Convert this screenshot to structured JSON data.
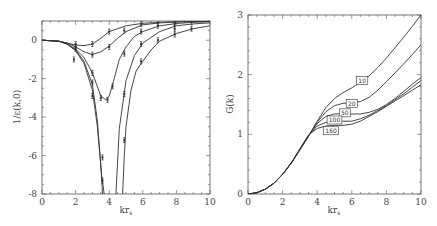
{
  "chart_data": [
    {
      "type": "line",
      "title": "",
      "xlabel": "kr_s",
      "ylabel": "1/ε(k,0)",
      "xlim": [
        0,
        10
      ],
      "ylim": [
        -8,
        1
      ],
      "xticks": [
        0,
        2,
        4,
        6,
        8,
        10
      ],
      "yticks": [
        0,
        -2,
        -4,
        -6,
        -8
      ],
      "grid": false,
      "series": [
        {
          "name": "curve1",
          "x": [
            0,
            1,
            1.5,
            2,
            2.5,
            3,
            3.5,
            4,
            5,
            6,
            7,
            8,
            9,
            10
          ],
          "y": [
            0,
            -0.05,
            -0.15,
            -0.25,
            -0.28,
            -0.2,
            0.1,
            0.45,
            0.75,
            0.88,
            0.93,
            0.96,
            0.97,
            0.98
          ]
        },
        {
          "name": "curve2",
          "x": [
            0,
            1,
            1.5,
            2,
            2.5,
            3,
            3.5,
            4,
            4.5,
            5,
            6,
            7,
            8,
            9,
            10
          ],
          "y": [
            0,
            -0.05,
            -0.15,
            -0.35,
            -0.6,
            -0.75,
            -0.6,
            -0.3,
            0.1,
            0.45,
            0.8,
            0.9,
            0.95,
            0.97,
            0.98
          ]
        },
        {
          "name": "curve3",
          "x": [
            0,
            1,
            1.5,
            2,
            2.5,
            3,
            3.5,
            3.8,
            4,
            4.3,
            4.6,
            5,
            5.5,
            6,
            7,
            8,
            9,
            10
          ],
          "y": [
            0,
            -0.05,
            -0.2,
            -0.45,
            -0.9,
            -1.7,
            -2.9,
            -3.1,
            -2.9,
            -2.0,
            -1.0,
            -0.35,
            0.2,
            0.45,
            0.75,
            0.87,
            0.93,
            0.96
          ]
        },
        {
          "name": "curve4",
          "x": [
            0,
            1,
            1.5,
            2,
            2.5,
            3,
            3.3,
            3.5,
            3.6
          ],
          "y": [
            0,
            -0.05,
            -0.2,
            -0.5,
            -1.1,
            -2.3,
            -4.2,
            -6.5,
            -8
          ]
        },
        {
          "name": "curve4b",
          "x": [
            4.4,
            4.6,
            5,
            5.5,
            6,
            7,
            8,
            9,
            10
          ],
          "y": [
            -8,
            -4.6,
            -2.1,
            -0.8,
            -0.15,
            0.45,
            0.75,
            0.85,
            0.9
          ]
        },
        {
          "name": "curve5",
          "x": [
            0,
            1,
            1.5,
            2,
            2.5,
            3,
            3.3,
            3.55,
            3.7
          ],
          "y": [
            0,
            -0.05,
            -0.2,
            -0.55,
            -1.2,
            -2.6,
            -4.5,
            -7,
            -8
          ]
        },
        {
          "name": "curve5b",
          "x": [
            4.8,
            4.9,
            5,
            5.3,
            5.6,
            6,
            6.5,
            7,
            8,
            9,
            10
          ],
          "y": [
            -8,
            -6,
            -4.5,
            -2.6,
            -1.6,
            -1.1,
            -0.5,
            -0.05,
            0.35,
            0.6,
            0.75
          ]
        }
      ],
      "points": [
        {
          "x": 2,
          "y": -0.2
        },
        {
          "x": 2,
          "y": -0.35
        },
        {
          "x": 2,
          "y": -0.45
        },
        {
          "x": 1.9,
          "y": -1.0
        },
        {
          "x": 3,
          "y": -0.2
        },
        {
          "x": 3,
          "y": -0.75
        },
        {
          "x": 3,
          "y": -1.7
        },
        {
          "x": 3,
          "y": -2.2
        },
        {
          "x": 3,
          "y": -2.9
        },
        {
          "x": 3.5,
          "y": -3.0
        },
        {
          "x": 3.6,
          "y": -6.1
        },
        {
          "x": 3.6,
          "y": -7.3
        },
        {
          "x": 3.9,
          "y": -3.1
        },
        {
          "x": 4,
          "y": 0.45
        },
        {
          "x": 4,
          "y": -0.35
        },
        {
          "x": 4.2,
          "y": -2.4
        },
        {
          "x": 4.9,
          "y": 0.5
        },
        {
          "x": 4.9,
          "y": -0.7
        },
        {
          "x": 4.9,
          "y": -2.8
        },
        {
          "x": 4.9,
          "y": -5.2
        },
        {
          "x": 5.9,
          "y": 0.85
        },
        {
          "x": 5.9,
          "y": 0.45
        },
        {
          "x": 5.9,
          "y": -0.2
        },
        {
          "x": 5.9,
          "y": -1.1
        },
        {
          "x": 6.9,
          "y": 0.9
        },
        {
          "x": 6.9,
          "y": 0.75
        },
        {
          "x": 6.9,
          "y": 0.0
        },
        {
          "x": 7.9,
          "y": 0.93
        },
        {
          "x": 7.9,
          "y": 0.9
        },
        {
          "x": 7.9,
          "y": 0.6
        },
        {
          "x": 7.9,
          "y": 0.3
        },
        {
          "x": 8.9,
          "y": 0.95
        },
        {
          "x": 8.9,
          "y": 0.6
        }
      ]
    },
    {
      "type": "line",
      "title": "",
      "xlabel": "kr_s",
      "ylabel": "G(k)",
      "xlim": [
        0,
        10
      ],
      "ylim": [
        0,
        3
      ],
      "xticks": [
        0,
        2,
        4,
        6,
        8,
        10
      ],
      "yticks": [
        0,
        1,
        2,
        3
      ],
      "grid": false,
      "series": [
        {
          "name": "10",
          "label_pos": [
            6.6,
            1.9
          ],
          "x": [
            0,
            0.5,
            1,
            1.5,
            2,
            2.5,
            3,
            3.5,
            4,
            4.5,
            5,
            5.5,
            6,
            6.5,
            7,
            7.5,
            8,
            8.5,
            9,
            9.5,
            10
          ],
          "y": [
            0,
            0.02,
            0.08,
            0.18,
            0.33,
            0.52,
            0.74,
            0.97,
            1.22,
            1.45,
            1.6,
            1.7,
            1.78,
            1.87,
            1.98,
            2.12,
            2.28,
            2.45,
            2.63,
            2.81,
            3.0
          ]
        },
        {
          "name": "20",
          "label_pos": [
            6.0,
            1.52
          ],
          "x": [
            0,
            0.5,
            1,
            1.5,
            2,
            2.5,
            3,
            3.5,
            4,
            4.5,
            5,
            5.5,
            6,
            6.5,
            7,
            7.5,
            8,
            8.5,
            9,
            9.5,
            10
          ],
          "y": [
            0,
            0.02,
            0.08,
            0.18,
            0.33,
            0.52,
            0.74,
            0.97,
            1.2,
            1.38,
            1.48,
            1.52,
            1.53,
            1.55,
            1.62,
            1.74,
            1.88,
            2.03,
            2.18,
            2.34,
            2.5
          ]
        },
        {
          "name": "50",
          "label_pos": [
            5.6,
            1.36
          ],
          "x": [
            0,
            0.5,
            1,
            1.5,
            2,
            2.5,
            3,
            3.5,
            4,
            4.5,
            5,
            5.5,
            6,
            6.5,
            7,
            7.5,
            8,
            8.5,
            9,
            9.5,
            10
          ],
          "y": [
            0,
            0.02,
            0.08,
            0.18,
            0.33,
            0.52,
            0.75,
            0.98,
            1.18,
            1.3,
            1.34,
            1.35,
            1.34,
            1.34,
            1.37,
            1.42,
            1.5,
            1.6,
            1.72,
            1.84,
            1.95
          ]
        },
        {
          "name": "100",
          "label_pos": [
            5.0,
            1.24
          ],
          "x": [
            0,
            0.5,
            1,
            1.5,
            2,
            2.5,
            3,
            3.5,
            4,
            4.5,
            5,
            5.5,
            6,
            6.5,
            7,
            7.5,
            8,
            8.5,
            9,
            9.5,
            10
          ],
          "y": [
            0,
            0.02,
            0.08,
            0.18,
            0.33,
            0.52,
            0.75,
            0.98,
            1.14,
            1.2,
            1.22,
            1.22,
            1.22,
            1.26,
            1.32,
            1.4,
            1.48,
            1.58,
            1.68,
            1.79,
            1.9
          ]
        },
        {
          "name": "160",
          "label_pos": [
            4.8,
            1.06
          ],
          "x": [
            0,
            0.5,
            1,
            1.5,
            2,
            2.5,
            3,
            3.5,
            4,
            4.5,
            5,
            5.5,
            6,
            6.5,
            7,
            7.5,
            8,
            8.5,
            9,
            9.5,
            10
          ],
          "y": [
            0,
            0.02,
            0.08,
            0.18,
            0.33,
            0.52,
            0.76,
            0.99,
            1.1,
            1.14,
            1.15,
            1.15,
            1.17,
            1.22,
            1.3,
            1.38,
            1.47,
            1.56,
            1.65,
            1.74,
            1.83
          ]
        }
      ]
    }
  ],
  "panels": {
    "left": {
      "ylabel": "1/ε(k,0)",
      "xlabel_main": "kr",
      "xlabel_sub": "s"
    },
    "right": {
      "ylabel": "G(k)",
      "xlabel_main": "kr",
      "xlabel_sub": "s"
    }
  }
}
